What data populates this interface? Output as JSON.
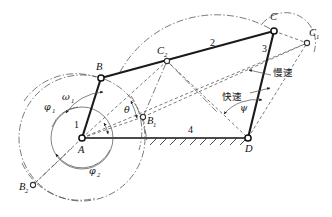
{
  "figure": {
    "type": "four-bar-linkage-mechanism-diagram",
    "background_color": "#ffffff",
    "line_color": "#1a1a1a",
    "construction_color": "#4d4d4d"
  },
  "joints": {
    "A": {
      "label": "A",
      "x": 82,
      "y": 138
    },
    "B": {
      "label": "B",
      "x": 101,
      "y": 78
    },
    "B1": {
      "label": "B",
      "sub": "1",
      "x": 143,
      "y": 117
    },
    "B2": {
      "label": "B",
      "sub": "2",
      "x": 33,
      "y": 185
    },
    "C": {
      "label": "C",
      "x": 274,
      "y": 31
    },
    "C1": {
      "label": "C",
      "sub": "1",
      "x": 307,
      "y": 43
    },
    "C2": {
      "label": "C",
      "sub": "2",
      "x": 167,
      "y": 61
    },
    "D": {
      "label": "D",
      "x": 248,
      "y": 138
    }
  },
  "links": {
    "crank": {
      "label": "1",
      "x": 77,
      "y": 124
    },
    "coupler": {
      "label": "2",
      "x": 213,
      "y": 42
    },
    "rocker": {
      "label": "3",
      "x": 265,
      "y": 48
    },
    "frame": {
      "label": "4",
      "x": 191,
      "y": 133
    }
  },
  "angles": {
    "phi1": {
      "label": "φ",
      "sub": "1",
      "x": 50,
      "y": 106
    },
    "phi2": {
      "label": "φ",
      "sub": "2",
      "x": 95,
      "y": 170
    },
    "omega1": {
      "label": "ω",
      "sub": "1",
      "x": 68,
      "y": 96
    },
    "theta": {
      "label": "θ",
      "x": 128,
      "y": 109
    },
    "psi": {
      "label": "ψ",
      "x": 244,
      "y": 107
    }
  },
  "annotations": {
    "slow_speed": {
      "text": "慢速",
      "x": 272,
      "y": 72
    },
    "fast_speed": {
      "text": "快速",
      "x": 231,
      "y": 96
    }
  }
}
